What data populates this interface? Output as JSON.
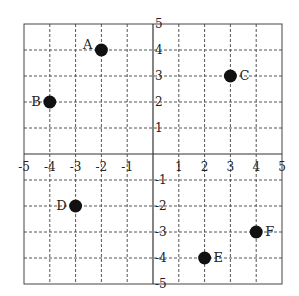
{
  "chart_data": {
    "type": "scatter",
    "title": "",
    "xlabel": "",
    "ylabel": "",
    "xlim": [
      -5,
      5
    ],
    "ylim": [
      -5,
      5
    ],
    "grid": true,
    "x_ticks": [
      -5,
      -4,
      -3,
      -2,
      -1,
      1,
      2,
      3,
      4,
      5
    ],
    "y_ticks": [
      5,
      4,
      3,
      2,
      1,
      -1,
      -2,
      -3,
      -4,
      -5
    ],
    "points": [
      {
        "label": "A",
        "x": -2,
        "y": 4,
        "label_side": "left"
      },
      {
        "label": "B",
        "x": -4,
        "y": 2,
        "label_side": "left"
      },
      {
        "label": "C",
        "x": 3,
        "y": 3,
        "label_side": "right"
      },
      {
        "label": "D",
        "x": -3,
        "y": -2,
        "label_side": "left"
      },
      {
        "label": "E",
        "x": 2,
        "y": -4,
        "label_side": "right"
      },
      {
        "label": "F",
        "x": 4,
        "y": -3,
        "label_side": "right"
      }
    ]
  },
  "colors": {
    "ink": "#222222",
    "grid": "#555555",
    "background": "#ffffff"
  }
}
